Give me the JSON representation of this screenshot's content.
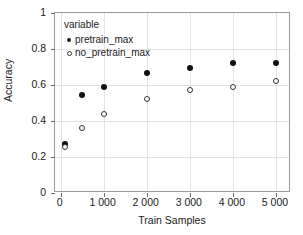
{
  "chart_data": {
    "type": "scatter",
    "title": "",
    "xlabel": "Train Samples",
    "ylabel": "Accuracy",
    "xlim": [
      -130,
      5350
    ],
    "ylim": [
      0,
      1
    ],
    "grid": true,
    "legend_position": "top-left",
    "legend_title": "variable",
    "xticks": [
      0,
      1000,
      2000,
      3000,
      4000,
      5000
    ],
    "xticklabels": [
      "0",
      "1 000",
      "2 000",
      "3 000",
      "4 000",
      "5 000"
    ],
    "yticks": [
      0,
      0.2,
      0.4,
      0.6,
      0.8,
      1
    ],
    "yticklabels": [
      "0",
      "0.2",
      "0.4",
      "0.6",
      "0.8",
      "1"
    ],
    "x": [
      100,
      500,
      1000,
      2000,
      3000,
      4000,
      5000
    ],
    "series": [
      {
        "name": "pretrain_max",
        "marker": "filled-circle",
        "color": "#111111",
        "values": [
          0.27,
          0.545,
          0.59,
          0.665,
          0.695,
          0.72,
          0.72
        ]
      },
      {
        "name": "no_pretrain_max",
        "marker": "open-circle",
        "color": "#333333",
        "values": [
          0.255,
          0.36,
          0.44,
          0.52,
          0.575,
          0.59,
          0.625
        ]
      }
    ]
  }
}
